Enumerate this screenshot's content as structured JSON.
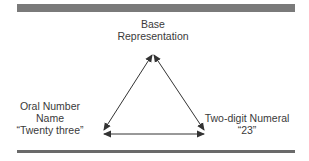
{
  "diagram": {
    "nodes": {
      "top": {
        "lines": [
          "Base",
          "Representation"
        ]
      },
      "left": {
        "lines": [
          "Oral Number",
          "Name",
          "“Twenty three”"
        ]
      },
      "right": {
        "lines": [
          "Two-digit Numeral",
          "“23”"
        ]
      }
    },
    "edges": [
      {
        "from": "top",
        "to": "left",
        "type": "bidirectional"
      },
      {
        "from": "top",
        "to": "right",
        "type": "bidirectional"
      },
      {
        "from": "left",
        "to": "right",
        "type": "bidirectional"
      }
    ],
    "colors": {
      "bar": "#7a7a7a",
      "line": "#333333",
      "text": "#3a3a3a"
    }
  }
}
